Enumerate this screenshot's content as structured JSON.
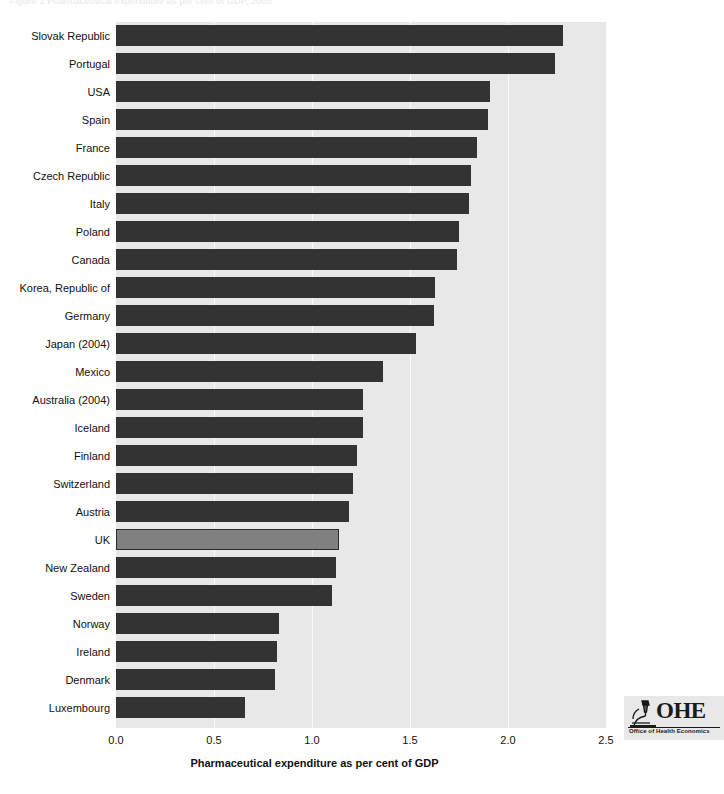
{
  "figure": {
    "caption_fragment": "Figure 1  Pharmaceutical expenditure as per cent of GDP, 2005"
  },
  "logo": {
    "wordmark": "OHE",
    "subtitle": "Office of Health Economics",
    "icon": "microscope-icon"
  },
  "colors": {
    "bar": "#333333",
    "bar_highlight": "#808080",
    "plot_background": "#e8e8e8",
    "gridline": "#fafafa",
    "text": "#111111"
  },
  "chart_data": {
    "type": "bar",
    "orientation": "horizontal",
    "title": "",
    "subtitle": "",
    "xlabel": "Pharmaceutical expenditure as per cent of GDP",
    "ylabel": "",
    "xlim": [
      0.0,
      2.5
    ],
    "xticks": [
      "0.0",
      "0.5",
      "1.0",
      "1.5",
      "2.0",
      "2.5"
    ],
    "xtick_values": [
      0.0,
      0.5,
      1.0,
      1.5,
      2.0,
      2.5
    ],
    "grid": "vertical",
    "legend": "none",
    "highlight_category": "UK",
    "categories": [
      "Slovak Republic",
      "Portugal",
      "USA",
      "Spain",
      "France",
      "Czech Republic",
      "Italy",
      "Poland",
      "Canada",
      "Korea, Republic of",
      "Germany",
      "Japan (2004)",
      "Mexico",
      "Australia (2004)",
      "Iceland",
      "Finland",
      "Switzerland",
      "Austria",
      "UK",
      "New Zealand",
      "Sweden",
      "Norway",
      "Ireland",
      "Denmark",
      "Luxembourg"
    ],
    "values": [
      2.28,
      2.24,
      1.91,
      1.9,
      1.84,
      1.81,
      1.8,
      1.75,
      1.74,
      1.63,
      1.62,
      1.53,
      1.36,
      1.26,
      1.26,
      1.23,
      1.21,
      1.19,
      1.14,
      1.12,
      1.1,
      0.83,
      0.82,
      0.81,
      0.66
    ]
  }
}
